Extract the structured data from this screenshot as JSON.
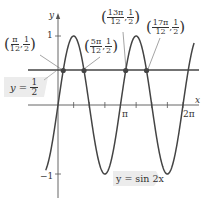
{
  "chart_data": {
    "type": "line",
    "title": "",
    "function": "y = sin 2x",
    "xlabel": "x",
    "ylabel": "y",
    "x_ticks": [
      "π",
      "2π"
    ],
    "y_ticks": [
      "1",
      "-1"
    ],
    "xlim": [
      -0.6,
      6.9
    ],
    "ylim": [
      -1.2,
      1.3
    ],
    "horizontal_line": {
      "label": "y = 1/2",
      "y": 0.5
    },
    "series": [
      {
        "name": "y = sin 2x",
        "expr": "sin(2x)"
      },
      {
        "name": "y = 1/2",
        "expr": "0.5"
      }
    ],
    "intersection_points": [
      {
        "label": "(π/12, 1/2)",
        "x_num": "π",
        "x_den": "12",
        "y_num": "1",
        "y_den": "2"
      },
      {
        "label": "(5π/12, 1/2)",
        "x_num": "5π",
        "x_den": "12",
        "y_num": "1",
        "y_den": "2"
      },
      {
        "label": "(13π/12, 1/2)",
        "x_num": "13π",
        "x_den": "12",
        "y_num": "1",
        "y_den": "2"
      },
      {
        "label": "(17π/12, 1/2)",
        "x_num": "17π",
        "x_den": "12",
        "y_num": "1",
        "y_den": "2"
      }
    ]
  },
  "labels": {
    "y_axis": "y",
    "x_axis": "x",
    "pi": "π",
    "two_pi": "2π",
    "one": "1",
    "neg_one": "−1",
    "curve_label": "y = sin 2x",
    "line_label_prefix": "y = ",
    "line_num": "1",
    "line_den": "2"
  },
  "colors": {
    "curve": "#444444",
    "axis": "#444444",
    "point": "#444444",
    "callout_bg": "#ececec"
  }
}
